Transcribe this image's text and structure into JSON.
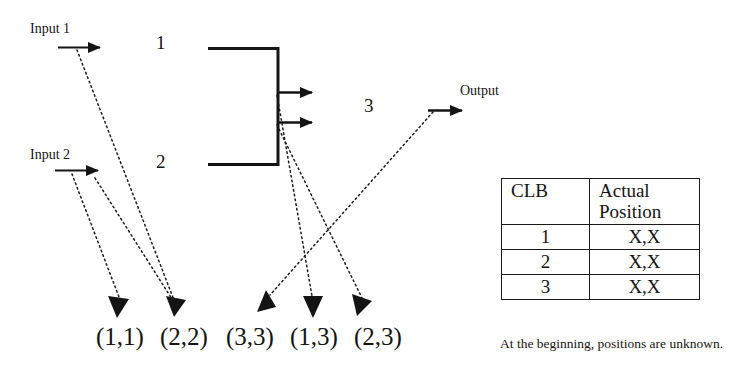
{
  "diagram": {
    "inputs": [
      {
        "id": "input-1",
        "label": "Input 1"
      },
      {
        "id": "input-2",
        "label": "Input 2"
      }
    ],
    "blocks": [
      {
        "id": "block-1",
        "label": "1"
      },
      {
        "id": "block-2",
        "label": "2"
      },
      {
        "id": "block-3",
        "label": "3"
      }
    ],
    "output": {
      "id": "output",
      "label": "Output"
    },
    "positions": [
      {
        "id": "pos-1-1",
        "label": "(1,1)"
      },
      {
        "id": "pos-2-2",
        "label": "(2,2)"
      },
      {
        "id": "pos-3-3",
        "label": "(3,3)"
      },
      {
        "id": "pos-1-3",
        "label": "(1,3)"
      },
      {
        "id": "pos-2-3",
        "label": "(2,3)"
      }
    ],
    "colors": {
      "ink": "#1a1a1a",
      "background": "#ffffff"
    }
  },
  "table": {
    "headers": [
      "CLB",
      "Actual Position"
    ],
    "header_clb": "CLB",
    "header_position_line1": "Actual",
    "header_position_line2": "Position",
    "rows": [
      {
        "clb": "1",
        "position": "X,X"
      },
      {
        "clb": "2",
        "position": "X,X"
      },
      {
        "clb": "3",
        "position": "X,X"
      }
    ],
    "caption": "At the beginning, positions are unknown."
  }
}
